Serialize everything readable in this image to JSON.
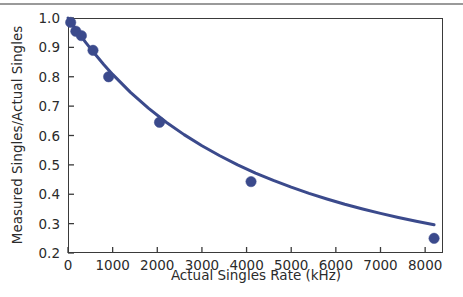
{
  "chart_data": {
    "type": "scatter",
    "title": "",
    "xlabel": "Actual Singles Rate (kHz)",
    "ylabel": "Measured Singles/Actual Singles",
    "xlim": [
      0,
      8400
    ],
    "ylim": [
      0.2,
      1.0
    ],
    "grid": false,
    "legend": null,
    "xticks": [
      0,
      1000,
      2000,
      3000,
      4000,
      5000,
      6000,
      7000,
      8000
    ],
    "xticklabels": [
      "0",
      "1000",
      "2000",
      "3000",
      "4000",
      "5000",
      "6000",
      "7000",
      "8000"
    ],
    "yticks": [
      0.2,
      0.3,
      0.4,
      0.5,
      0.6,
      0.7,
      0.8,
      0.9,
      1.0
    ],
    "yticklabels": [
      "0.2",
      "0.3",
      "0.4",
      "0.5",
      "0.6",
      "0.7",
      "0.8",
      "0.9",
      "1.0"
    ],
    "series": [
      {
        "name": "Measured data points",
        "type": "scatter",
        "marker": "filled-circle",
        "color": "#3b4a8c",
        "points": [
          {
            "x": 60,
            "y": 0.985
          },
          {
            "x": 175,
            "y": 0.955
          },
          {
            "x": 300,
            "y": 0.94
          },
          {
            "x": 560,
            "y": 0.89
          },
          {
            "x": 910,
            "y": 0.8
          },
          {
            "x": 2050,
            "y": 0.645
          },
          {
            "x": 4100,
            "y": 0.443
          },
          {
            "x": 8200,
            "y": 0.25
          }
        ]
      },
      {
        "name": "Fitted decay curve",
        "type": "line",
        "color": "#3b4a8c",
        "x": [
          0,
          200,
          400,
          600,
          800,
          1000,
          1400,
          1800,
          2200,
          2600,
          3000,
          3400,
          3800,
          4200,
          4600,
          5000,
          5400,
          5800,
          6200,
          6600,
          7000,
          7400,
          7800,
          8200
        ],
        "y": [
          1.0,
          0.957,
          0.916,
          0.878,
          0.842,
          0.808,
          0.747,
          0.693,
          0.645,
          0.603,
          0.565,
          0.531,
          0.5,
          0.472,
          0.447,
          0.424,
          0.403,
          0.384,
          0.366,
          0.35,
          0.335,
          0.321,
          0.308,
          0.296
        ]
      }
    ]
  },
  "colors": {
    "curve": "#3b4a8c",
    "marker": "#3b4a8c",
    "axis": "#3a3a3a",
    "text": "#2b2b2b",
    "rule": "#9a9a9a",
    "background": "#ffffff"
  }
}
